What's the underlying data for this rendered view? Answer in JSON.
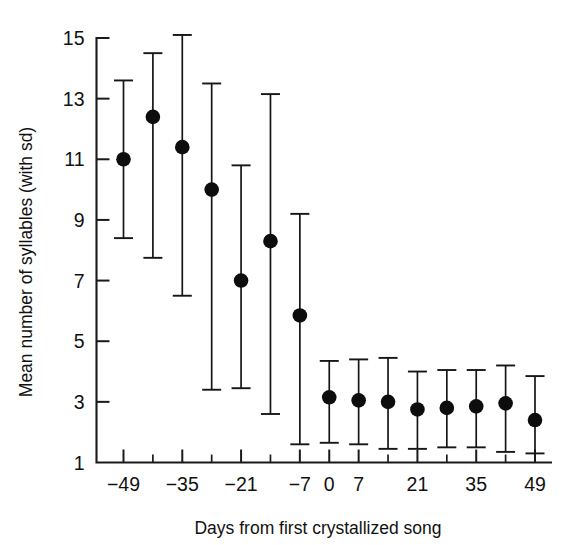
{
  "figure": {
    "background_color": "#ffffff",
    "ink_color": "#111111",
    "marker_color": "#0d0d0d"
  },
  "chart_data": {
    "type": "scatter",
    "title": "",
    "xlabel": "Days from first crystallized song",
    "ylabel": "Mean number of syllables (with sd)",
    "xlim": [
      -56,
      56
    ],
    "ylim": [
      1,
      15
    ],
    "grid": false,
    "legend": null,
    "error_bars": "sd",
    "x_major_ticks": [
      -49,
      -35,
      -21,
      -7,
      0,
      7,
      21,
      35,
      49
    ],
    "x_major_tick_labels": [
      "−49",
      "−35",
      "−21",
      "−7",
      "0",
      "7",
      "21",
      "35",
      "49"
    ],
    "x_minor_ticks": [
      -42,
      -28,
      -14,
      14,
      28,
      42
    ],
    "y_ticks": [
      1,
      3,
      5,
      7,
      9,
      11,
      13,
      15
    ],
    "y_tick_labels": [
      "1",
      "3",
      "5",
      "7",
      "9",
      "11",
      "13",
      "15"
    ],
    "x": [
      -49,
      -42,
      -35,
      -28,
      -21,
      -14,
      -7,
      0,
      7,
      14,
      21,
      28,
      35,
      42,
      49
    ],
    "values": [
      11.0,
      12.4,
      11.4,
      10.0,
      7.0,
      8.3,
      5.85,
      3.15,
      3.05,
      3.0,
      2.75,
      2.8,
      2.85,
      2.95,
      2.4
    ],
    "error_upper": [
      13.6,
      14.5,
      15.1,
      13.5,
      10.8,
      13.15,
      9.2,
      4.35,
      4.4,
      4.45,
      4.0,
      4.05,
      4.05,
      4.2,
      3.85
    ],
    "error_lower": [
      8.4,
      7.75,
      6.5,
      3.4,
      3.45,
      2.6,
      1.6,
      1.65,
      1.6,
      1.45,
      1.45,
      1.5,
      1.5,
      1.35,
      1.3
    ],
    "series": [
      {
        "name": "Mean number of syllables",
        "marker": "filled-circle",
        "values": [
          11.0,
          12.4,
          11.4,
          10.0,
          7.0,
          8.3,
          5.85,
          3.15,
          3.05,
          3.0,
          2.75,
          2.8,
          2.85,
          2.95,
          2.4
        ]
      }
    ]
  }
}
